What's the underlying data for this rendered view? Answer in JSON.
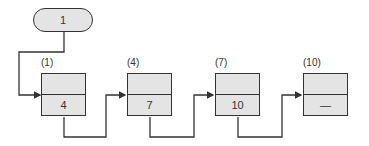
{
  "start": {
    "value": "1"
  },
  "nodes": [
    {
      "label": "(1)",
      "value": "4"
    },
    {
      "label": "(4)",
      "value": "7"
    },
    {
      "label": "(7)",
      "value": "10"
    },
    {
      "label": "(10)",
      "value": "—"
    }
  ],
  "colors": {
    "fill": "#e4e4e4",
    "stroke": "#333333"
  }
}
